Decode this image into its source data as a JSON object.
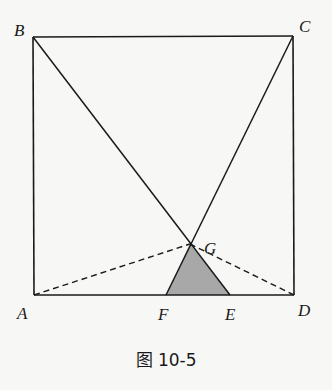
{
  "figure": {
    "caption": "图 10-5",
    "background": "#f7f7f6",
    "stroke_color": "#1a1a1a",
    "shade_color": "#a8a8a8"
  },
  "points": {
    "A": {
      "label": "A",
      "x": 34,
      "y": 295
    },
    "B": {
      "label": "B",
      "x": 33,
      "y": 37
    },
    "C": {
      "label": "C",
      "x": 293,
      "y": 36
    },
    "D": {
      "label": "D",
      "x": 294,
      "y": 295
    },
    "E": {
      "label": "E",
      "x": 230,
      "y": 295
    },
    "F": {
      "label": "F",
      "x": 166,
      "y": 295
    },
    "G": {
      "label": "G",
      "x": 190,
      "y": 244
    }
  },
  "segments": {
    "solid": [
      "AB",
      "BC",
      "CD",
      "DA",
      "BE",
      "CF"
    ],
    "dashed": [
      "AG",
      "DG"
    ]
  },
  "shaded_region": {
    "vertices": [
      "F",
      "G",
      "E"
    ],
    "description": "triangle FGE"
  }
}
